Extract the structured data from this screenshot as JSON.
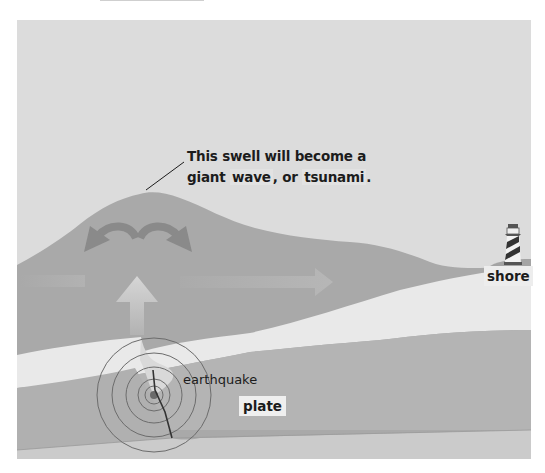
{
  "diagram": {
    "caption": {
      "line1": "This swell will become a",
      "line2_prefix": "giant",
      "term_wave": "wave",
      "line2_middle": ", or",
      "term_tsunami": "tsunami",
      "line2_suffix": "."
    },
    "labels": {
      "shore": "shore",
      "earthquake": "earthquake",
      "plate": "plate"
    },
    "icons": [
      "lighthouse-icon",
      "curved-arrow-left-icon",
      "curved-arrow-right-icon",
      "up-arrow-icon",
      "right-arrow-icon",
      "epicenter-rings-icon"
    ],
    "colors": {
      "sky": "#dcdcdc",
      "water": "#a9a9a9",
      "crust_light": "#e8e8e8",
      "plate": "#b6b6b6",
      "bedrock": "#c9c9c9",
      "arrow_dark": "#8a8a8a",
      "arrow_light": "#d2d2d2"
    }
  }
}
